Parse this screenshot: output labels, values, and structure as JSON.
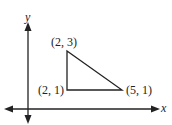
{
  "diagram": {
    "axes": {
      "x_label": "x",
      "y_label": "y"
    },
    "triangle": {
      "vertices": [
        {
          "label": "(2, 3)",
          "x": 2,
          "y": 3
        },
        {
          "label": "(2, 1)",
          "x": 2,
          "y": 1
        },
        {
          "label": "(5, 1)",
          "x": 5,
          "y": 1
        }
      ]
    },
    "colors": {
      "line": "#222222",
      "background": "#ffffff"
    }
  }
}
